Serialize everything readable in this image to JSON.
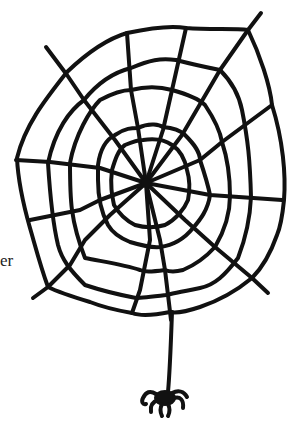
{
  "illustration": {
    "subject": "spider web with hanging spider",
    "ink_color": "#111111",
    "background_color": "#ffffff"
  },
  "partial_text": "er"
}
